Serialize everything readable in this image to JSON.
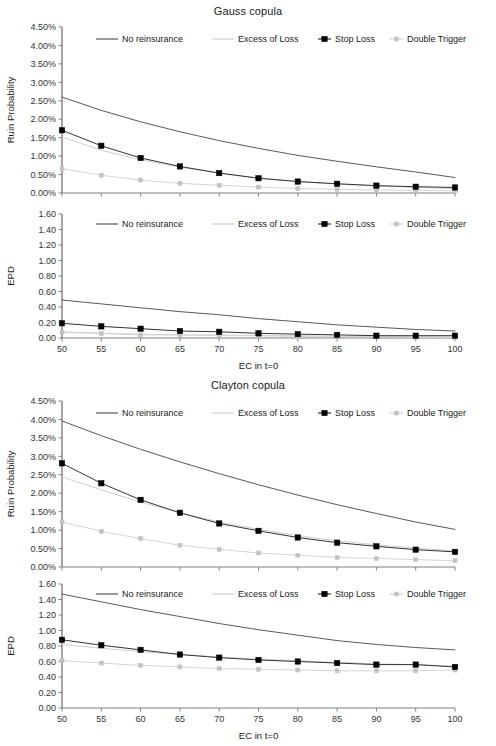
{
  "figure": {
    "width": 496,
    "height": 746,
    "background": "#ffffff",
    "footnote_artifact": "..."
  },
  "series_style": {
    "no_reinsurance": {
      "label": "No reinsurance",
      "color": "#595959",
      "marker": "none",
      "width": 1
    },
    "excess_of_loss": {
      "label": "Excess of Loss",
      "color": "#cfcfcf",
      "marker": "none",
      "width": 1
    },
    "stop_loss": {
      "label": "Stop Loss",
      "color": "#333333",
      "marker": "square",
      "marker_color": "#000000",
      "width": 1
    },
    "double_trigger": {
      "label": "Double Trigger",
      "color": "#d4d4d4",
      "marker": "square",
      "marker_color": "#c2c2c2",
      "width": 1
    }
  },
  "legend": {
    "position": "top-inside",
    "entries": [
      "No reinsurance",
      "Excess of Loss",
      "Stop Loss",
      "Double Trigger"
    ]
  },
  "chart_data": [
    {
      "id": "gauss-ruin",
      "type": "line",
      "title": "Gauss copula",
      "xlabel": "",
      "ylabel": "Ruin Probability",
      "x": [
        50,
        55,
        60,
        65,
        70,
        75,
        80,
        85,
        90,
        95,
        100
      ],
      "xticklabels": [
        "50",
        "55",
        "60",
        "65",
        "70",
        "75",
        "80",
        "85",
        "90",
        "95",
        "100"
      ],
      "xlim": [
        50,
        100
      ],
      "ylim": [
        0,
        4.5
      ],
      "yticks": [
        0,
        0.5,
        1.0,
        1.5,
        2.0,
        2.5,
        3.0,
        3.5,
        4.0,
        4.5
      ],
      "yticklabels": [
        "0.00%",
        "0.50%",
        "1.00%",
        "1.50%",
        "2.00%",
        "2.50%",
        "3.00%",
        "3.50%",
        "4.00%",
        "4.50%"
      ],
      "value_suffix": "%",
      "grid": false,
      "series": [
        {
          "name": "No reinsurance",
          "key": "no_reinsurance",
          "values": [
            2.6,
            2.24,
            1.93,
            1.66,
            1.42,
            1.21,
            1.02,
            0.86,
            0.71,
            0.57,
            0.42
          ]
        },
        {
          "name": "Excess of Loss",
          "key": "excess_of_loss",
          "values": [
            1.52,
            1.16,
            0.9,
            0.7,
            0.54,
            0.41,
            0.31,
            0.24,
            0.19,
            0.15,
            0.12
          ]
        },
        {
          "name": "Stop Loss",
          "key": "stop_loss",
          "values": [
            1.7,
            1.28,
            0.95,
            0.72,
            0.54,
            0.4,
            0.31,
            0.25,
            0.2,
            0.17,
            0.15
          ]
        },
        {
          "name": "Double Trigger",
          "key": "double_trigger",
          "values": [
            0.66,
            0.48,
            0.35,
            0.26,
            0.21,
            0.16,
            0.12,
            0.1,
            0.08,
            0.07,
            0.06
          ]
        }
      ]
    },
    {
      "id": "gauss-epd",
      "type": "line",
      "title": "",
      "xlabel": "EC in t=0",
      "ylabel": "EPD",
      "x": [
        50,
        55,
        60,
        65,
        70,
        75,
        80,
        85,
        90,
        95,
        100
      ],
      "xticklabels": [
        "50",
        "55",
        "60",
        "65",
        "70",
        "75",
        "80",
        "85",
        "90",
        "95",
        "100"
      ],
      "xlim": [
        50,
        100
      ],
      "ylim": [
        0,
        1.6
      ],
      "yticks": [
        0,
        0.2,
        0.4,
        0.6,
        0.8,
        1.0,
        1.2,
        1.4,
        1.6
      ],
      "yticklabels": [
        "0.00",
        "0.20",
        "0.40",
        "0.60",
        "0.80",
        "1.00",
        "1.20",
        "1.40",
        "1.60"
      ],
      "value_suffix": "",
      "grid": false,
      "series": [
        {
          "name": "No reinsurance",
          "key": "no_reinsurance",
          "values": [
            0.49,
            0.44,
            0.39,
            0.34,
            0.3,
            0.25,
            0.21,
            0.17,
            0.14,
            0.11,
            0.09
          ]
        },
        {
          "name": "Excess of Loss",
          "key": "excess_of_loss",
          "values": [
            0.08,
            0.06,
            0.05,
            0.04,
            0.04,
            0.03,
            0.03,
            0.02,
            0.02,
            0.02,
            0.01
          ]
        },
        {
          "name": "Stop Loss",
          "key": "stop_loss",
          "values": [
            0.19,
            0.15,
            0.12,
            0.09,
            0.08,
            0.06,
            0.05,
            0.04,
            0.03,
            0.03,
            0.03
          ]
        },
        {
          "name": "Double Trigger",
          "key": "double_trigger",
          "values": [
            0.07,
            0.06,
            0.04,
            0.04,
            0.03,
            0.03,
            0.02,
            0.02,
            0.02,
            0.01,
            0.01
          ]
        }
      ]
    },
    {
      "id": "clayton-ruin",
      "type": "line",
      "title": "Clayton copula",
      "xlabel": "",
      "ylabel": "Ruin Probability",
      "x": [
        50,
        55,
        60,
        65,
        70,
        75,
        80,
        85,
        90,
        95,
        100
      ],
      "xticklabels": [
        "50",
        "55",
        "60",
        "65",
        "70",
        "75",
        "80",
        "85",
        "90",
        "95",
        "100"
      ],
      "xlim": [
        50,
        100
      ],
      "ylim": [
        0,
        4.5
      ],
      "yticks": [
        0,
        0.5,
        1.0,
        1.5,
        2.0,
        2.5,
        3.0,
        3.5,
        4.0,
        4.5
      ],
      "yticklabels": [
        "0.00%",
        "0.50%",
        "1.00%",
        "1.50%",
        "2.00%",
        "2.50%",
        "3.00%",
        "3.50%",
        "4.00%",
        "4.50%"
      ],
      "value_suffix": "%",
      "grid": false,
      "series": [
        {
          "name": "No reinsurance",
          "key": "no_reinsurance",
          "values": [
            3.96,
            3.56,
            3.19,
            2.85,
            2.53,
            2.23,
            1.95,
            1.69,
            1.45,
            1.22,
            1.02
          ]
        },
        {
          "name": "Excess of Loss",
          "key": "excess_of_loss",
          "values": [
            2.44,
            2.09,
            1.76,
            1.47,
            1.22,
            1.02,
            0.85,
            0.71,
            0.6,
            0.51,
            0.44
          ]
        },
        {
          "name": "Stop Loss",
          "key": "stop_loss",
          "values": [
            2.81,
            2.27,
            1.82,
            1.47,
            1.18,
            0.98,
            0.8,
            0.66,
            0.56,
            0.47,
            0.41
          ]
        },
        {
          "name": "Double Trigger",
          "key": "double_trigger",
          "values": [
            1.22,
            0.97,
            0.77,
            0.59,
            0.48,
            0.38,
            0.32,
            0.26,
            0.23,
            0.2,
            0.17
          ]
        }
      ]
    },
    {
      "id": "clayton-epd",
      "type": "line",
      "title": "",
      "xlabel": "EC in t=0",
      "ylabel": "EPD",
      "x": [
        50,
        55,
        60,
        65,
        70,
        75,
        80,
        85,
        90,
        95,
        100
      ],
      "xticklabels": [
        "50",
        "55",
        "60",
        "65",
        "70",
        "75",
        "80",
        "85",
        "90",
        "95",
        "100"
      ],
      "xlim": [
        50,
        100
      ],
      "ylim": [
        0,
        1.6
      ],
      "yticks": [
        0,
        0.2,
        0.4,
        0.6,
        0.8,
        1.0,
        1.2,
        1.4,
        1.6
      ],
      "yticklabels": [
        "0.00",
        "0.20",
        "0.40",
        "0.60",
        "0.80",
        "1.00",
        "1.20",
        "1.40",
        "1.60"
      ],
      "value_suffix": "",
      "grid": false,
      "series": [
        {
          "name": "No reinsurance",
          "key": "no_reinsurance",
          "values": [
            1.47,
            1.37,
            1.27,
            1.18,
            1.09,
            1.01,
            0.94,
            0.87,
            0.82,
            0.78,
            0.75
          ]
        },
        {
          "name": "Excess of Loss",
          "key": "excess_of_loss",
          "values": [
            0.82,
            0.77,
            0.73,
            0.69,
            0.66,
            0.63,
            0.61,
            0.59,
            0.57,
            0.56,
            0.54
          ]
        },
        {
          "name": "Stop Loss",
          "key": "stop_loss",
          "values": [
            0.88,
            0.81,
            0.75,
            0.69,
            0.65,
            0.62,
            0.6,
            0.58,
            0.56,
            0.56,
            0.53
          ]
        },
        {
          "name": "Double Trigger",
          "key": "double_trigger",
          "values": [
            0.61,
            0.58,
            0.55,
            0.53,
            0.51,
            0.5,
            0.49,
            0.48,
            0.48,
            0.48,
            0.49
          ]
        }
      ]
    }
  ]
}
